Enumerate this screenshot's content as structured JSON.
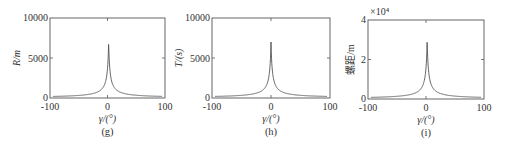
{
  "chart_data": [
    {
      "type": "line",
      "panel_label": "(g)",
      "title": "",
      "xlabel": "γ/(°)",
      "ylabel": "R/m",
      "xlim": [
        -100,
        100
      ],
      "ylim": [
        0,
        10000
      ],
      "xticks": [
        "-100",
        "0",
        "100"
      ],
      "yticks": [
        "0",
        "5000",
        "10000"
      ],
      "y_multiplier": "",
      "grid": false,
      "legend": null,
      "peak": {
        "x": 2,
        "y": 7000
      },
      "series": [
        {
          "name": "R",
          "x": [
            -90,
            -60,
            -30,
            -15,
            -8,
            -4,
            -2,
            0,
            1,
            2,
            3,
            4,
            6,
            8,
            15,
            30,
            60,
            90
          ],
          "y": [
            100,
            150,
            300,
            600,
            1100,
            2000,
            3200,
            5000,
            6200,
            7000,
            6200,
            5000,
            3200,
            2000,
            1100,
            600,
            300,
            150
          ]
        }
      ]
    },
    {
      "type": "line",
      "panel_label": "(h)",
      "title": "",
      "xlabel": "γ/(°)",
      "ylabel": "T/(s)",
      "xlim": [
        -100,
        100
      ],
      "ylim": [
        0,
        10000
      ],
      "xticks": [
        "-100",
        "0",
        "100"
      ],
      "yticks": [
        "0",
        "5000",
        "10000"
      ],
      "y_multiplier": "",
      "grid": false,
      "legend": null,
      "peak": {
        "x": 0,
        "y": 7000
      },
      "series": [
        {
          "name": "T",
          "x": [
            -90,
            -60,
            -30,
            -15,
            -8,
            -4,
            -2,
            -1,
            0,
            1,
            2,
            4,
            8,
            15,
            30,
            60,
            90
          ],
          "y": [
            100,
            150,
            300,
            600,
            1100,
            2000,
            3200,
            5000,
            7000,
            5000,
            3200,
            2000,
            1100,
            600,
            300,
            150,
            100
          ]
        }
      ]
    },
    {
      "type": "line",
      "panel_label": "(i)",
      "title": "",
      "xlabel": "γ/(°)",
      "ylabel": "螺距/m",
      "xlim": [
        -100,
        100
      ],
      "ylim": [
        0,
        40000
      ],
      "xticks": [
        "-100",
        "0",
        "100"
      ],
      "yticks": [
        "0",
        "2",
        "4"
      ],
      "y_multiplier": "×10⁴",
      "grid": false,
      "legend": null,
      "peak": {
        "x": 2,
        "y": 30000
      },
      "series": [
        {
          "name": "螺距",
          "x": [
            -90,
            -60,
            -30,
            -15,
            -8,
            -4,
            -2,
            0,
            1,
            2,
            3,
            4,
            6,
            8,
            15,
            30,
            60,
            90
          ],
          "y": [
            400,
            600,
            1200,
            2400,
            4400,
            8000,
            12800,
            20000,
            25000,
            30000,
            25000,
            20000,
            12800,
            8000,
            4400,
            2400,
            1200,
            600
          ]
        }
      ]
    }
  ],
  "panels": [
    {
      "box": {
        "x": 50,
        "y": 18,
        "w": 115,
        "h": 80
      }
    },
    {
      "box": {
        "x": 212,
        "y": 18,
        "w": 118,
        "h": 80
      }
    },
    {
      "box": {
        "x": 368,
        "y": 20,
        "w": 116,
        "h": 79
      }
    }
  ]
}
